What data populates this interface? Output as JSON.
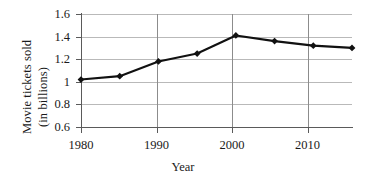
{
  "chart_data": {
    "type": "line",
    "title": "",
    "xlabel": "Year",
    "ylabel": "Movie tickets sold (in billions)",
    "ylabel_line1": "Movie tickets sold",
    "ylabel_line2": "(in billions)",
    "x": [
      1980,
      1985,
      1990,
      1995,
      2000,
      2005,
      2010,
      2015
    ],
    "values": [
      1.02,
      1.05,
      1.18,
      1.25,
      1.41,
      1.36,
      1.32,
      1.3
    ],
    "series": [
      {
        "name": "Movie tickets sold",
        "values": [
          1.02,
          1.05,
          1.18,
          1.25,
          1.41,
          1.36,
          1.32,
          1.3
        ]
      }
    ],
    "xlim": [
      1980,
      2015
    ],
    "ylim": [
      0.6,
      1.6
    ],
    "xticks": [
      1980,
      1990,
      2000,
      2010
    ],
    "xtick_labels": [
      "1980",
      "1990",
      "2000",
      "2010"
    ],
    "yticks": [
      0.6,
      0.8,
      1.0,
      1.2,
      1.4,
      1.6
    ],
    "ytick_labels": [
      "0.6",
      "0.8",
      "1",
      "1.2",
      "1.4",
      "1.6"
    ],
    "grid": true,
    "grid_axis": "both",
    "legend": false,
    "marker": "diamond",
    "line_color": "#111111",
    "marker_color": "#111111",
    "grid_color": "#b9b9b9",
    "background_color": "#ffffff"
  },
  "axis": {
    "ytick_labels": [
      "1.6",
      "1.4",
      "1.2",
      "1",
      "0.8",
      "0.6"
    ],
    "xtick_labels": [
      "1980",
      "1990",
      "2000",
      "2010"
    ]
  }
}
